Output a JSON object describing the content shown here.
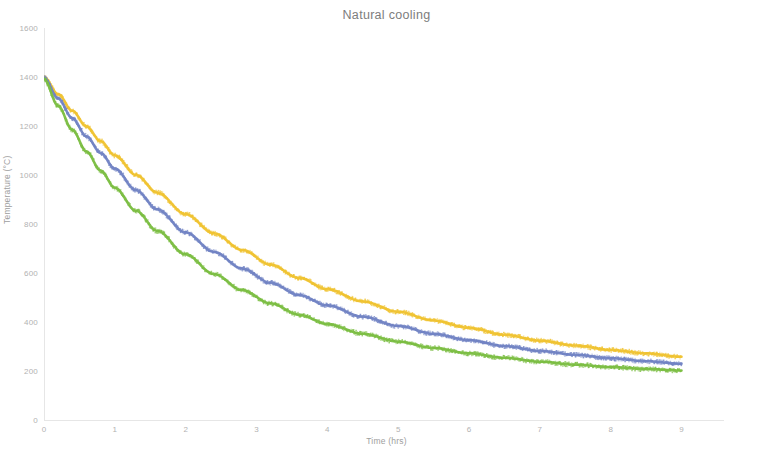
{
  "chart_data": {
    "type": "scatter",
    "title": "Natural cooling",
    "xlabel": "Time (hrs)",
    "ylabel": "Temperature (°C)",
    "xlim": [
      0,
      9.6
    ],
    "ylim": [
      0,
      1600
    ],
    "grid": false,
    "legend": "none",
    "xticks": [
      "0",
      "1",
      "2",
      "3",
      "4",
      "5",
      "6",
      "7",
      "8",
      "9"
    ],
    "xtick_values": [
      0,
      1,
      2,
      3,
      4,
      5,
      6,
      7,
      8,
      9
    ],
    "yticks": [
      "0",
      "200",
      "400",
      "600",
      "800",
      "1000",
      "1200",
      "1400",
      "1600"
    ],
    "ytick_values": [
      0,
      200,
      400,
      600,
      800,
      1000,
      1200,
      1400,
      1600
    ],
    "x": [
      0,
      0.2,
      0.4,
      0.6,
      0.8,
      1.0,
      1.3,
      1.6,
      2.0,
      2.4,
      2.8,
      3.2,
      3.6,
      4.0,
      4.5,
      5.0,
      5.5,
      6.0,
      6.5,
      7.0,
      7.5,
      8.0,
      8.5,
      9.0
    ],
    "series": [
      {
        "name": "yellow-curve",
        "color": "#F0C330",
        "values": [
          1400,
          1330,
          1262,
          1198,
          1138,
          1080,
          1000,
          928,
          840,
          762,
          694,
          634,
          580,
          534,
          484,
          442,
          406,
          376,
          348,
          324,
          304,
          286,
          272,
          258
        ]
      },
      {
        "name": "blue-curve",
        "color": "#7183C4",
        "values": [
          1398,
          1312,
          1232,
          1158,
          1090,
          1026,
          938,
          860,
          766,
          686,
          618,
          560,
          510,
          468,
          422,
          384,
          352,
          326,
          302,
          282,
          266,
          252,
          240,
          230
        ]
      },
      {
        "name": "green-curve",
        "color": "#7BBE42",
        "values": [
          1392,
          1282,
          1184,
          1096,
          1018,
          948,
          854,
          772,
          676,
          596,
          530,
          476,
          430,
          392,
          352,
          320,
          294,
          272,
          254,
          238,
          226,
          216,
          208,
          202
        ]
      }
    ]
  },
  "page": {
    "background_color": "#ffffff",
    "axis_color": "#e6e6e6",
    "text_color": "#8a8a8a"
  }
}
